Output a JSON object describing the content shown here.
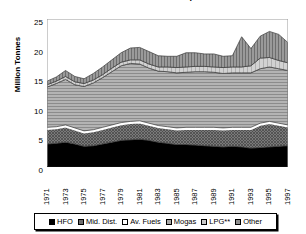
{
  "chart_data": {
    "type": "area",
    "stacked": true,
    "title": "Oil Products Consumption",
    "xlabel": "",
    "ylabel": "Million Tonnes",
    "ylim": [
      0,
      25
    ],
    "yticks": [
      0,
      5,
      10,
      15,
      20,
      25
    ],
    "grid": false,
    "legend_position": "bottom",
    "x": [
      1971,
      1972,
      1973,
      1974,
      1975,
      1976,
      1977,
      1978,
      1979,
      1980,
      1981,
      1982,
      1983,
      1984,
      1985,
      1986,
      1987,
      1988,
      1989,
      1990,
      1991,
      1992,
      1993,
      1994,
      1995,
      1996,
      1997
    ],
    "xtick_labels": [
      "1971",
      "1973",
      "1975",
      "1977",
      "1979",
      "1981",
      "1983",
      "1985",
      "1987",
      "1989",
      "1991",
      "1993",
      "1995",
      "1997"
    ],
    "series": [
      {
        "name": "HFO",
        "swatch": "solid-black",
        "color": "#000000",
        "values": [
          3.9,
          4.0,
          4.2,
          3.9,
          3.5,
          3.6,
          3.9,
          4.2,
          4.5,
          4.6,
          4.7,
          4.5,
          4.2,
          4.0,
          3.8,
          3.8,
          3.7,
          3.6,
          3.5,
          3.4,
          3.5,
          3.4,
          3.2,
          3.3,
          3.4,
          3.5,
          3.6
        ]
      },
      {
        "name": "Mid. Dist.",
        "swatch": "dark-crosshatch",
        "color": "#6e6e6e",
        "values": [
          2.5,
          2.5,
          2.6,
          2.4,
          2.3,
          2.4,
          2.5,
          2.6,
          2.7,
          2.8,
          2.8,
          2.6,
          2.5,
          2.5,
          2.5,
          2.6,
          2.7,
          2.8,
          2.9,
          2.9,
          2.9,
          3.0,
          3.2,
          3.8,
          4.0,
          3.6,
          3.2
        ]
      },
      {
        "name": "Av. Fuels",
        "swatch": "white",
        "color": "#ffffff",
        "values": [
          0.3,
          0.3,
          0.3,
          0.3,
          0.3,
          0.3,
          0.3,
          0.3,
          0.3,
          0.3,
          0.3,
          0.3,
          0.3,
          0.3,
          0.3,
          0.3,
          0.3,
          0.3,
          0.3,
          0.3,
          0.3,
          0.3,
          0.3,
          0.3,
          0.3,
          0.3,
          0.3
        ]
      },
      {
        "name": "Mogas",
        "swatch": "gray-horizontal-lines",
        "color": "#a8a8a8",
        "values": [
          6.8,
          7.3,
          7.7,
          7.3,
          7.5,
          7.9,
          8.4,
          9.0,
          9.6,
          9.8,
          9.6,
          9.3,
          9.2,
          9.3,
          9.3,
          9.3,
          9.4,
          9.4,
          9.3,
          9.2,
          9.2,
          9.2,
          9.2,
          9.2,
          9.2,
          9.2,
          9.2
        ]
      },
      {
        "name": "LPG**",
        "swatch": "light-gray",
        "color": "#c8c8c8",
        "values": [
          0.4,
          0.4,
          0.5,
          0.5,
          0.5,
          0.5,
          0.5,
          0.6,
          0.6,
          0.6,
          0.7,
          0.7,
          0.7,
          0.8,
          0.9,
          0.9,
          0.9,
          0.9,
          0.9,
          1.0,
          1.0,
          1.0,
          1.2,
          1.8,
          1.6,
          1.4,
          1.3
        ]
      },
      {
        "name": "Other",
        "swatch": "vertical-hatch",
        "color": "#8e8e8e",
        "values": [
          0.6,
          0.7,
          1.0,
          0.9,
          0.8,
          1.1,
          1.3,
          1.4,
          1.6,
          2.0,
          2.1,
          2.1,
          1.9,
          1.8,
          1.9,
          2.4,
          2.3,
          2.1,
          2.2,
          1.9,
          1.9,
          5.1,
          2.9,
          3.7,
          4.4,
          4.4,
          3.4
        ]
      }
    ]
  }
}
